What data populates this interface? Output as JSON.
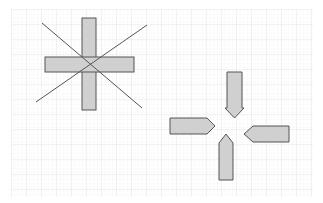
{
  "canvas": {
    "background": "#ffffff",
    "grid": {
      "x": 11,
      "y": 9,
      "width": 302,
      "height": 188,
      "minor_step": 3.75,
      "major_step": 15,
      "minor_color": "#eeeeee",
      "major_color": "#dcdcdc"
    }
  },
  "style": {
    "shape_fill": "#d0d0d0",
    "shape_stroke": "#555555",
    "line_stroke": "#555555"
  },
  "shapes": {
    "cross": {
      "vertical_bar": {
        "x": 82,
        "y": 18,
        "w": 14,
        "h": 92
      },
      "horizontal_bar": {
        "x": 45,
        "y": 57,
        "w": 89,
        "h": 15
      },
      "diagonal_1": {
        "x1": 42,
        "y1": 23,
        "x2": 142,
        "y2": 108
      },
      "diagonal_2": {
        "x1": 36,
        "y1": 102,
        "x2": 147,
        "y2": 25
      }
    },
    "arrows": [
      {
        "name": "arrow-down",
        "points": "227,72 242,72 242,108 244,108 234.5,118 225,108 227,108"
      },
      {
        "name": "arrow-right",
        "points": "170,118 207,118 215,126 207,134 170,134"
      },
      {
        "name": "arrow-left",
        "points": "289,126 289,142 253,142 244,134 253,126"
      },
      {
        "name": "arrow-up",
        "points": "219,180 233,180 233,143 226,134 219,143"
      }
    ]
  }
}
